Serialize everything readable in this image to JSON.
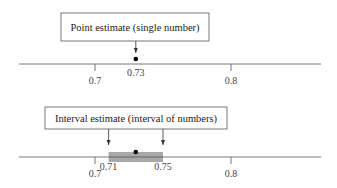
{
  "axis": {
    "min_value": 0.7,
    "max_value": 0.8,
    "tick_labels": [
      "0.7",
      "0.8"
    ]
  },
  "point_panel": {
    "label": "Point estimate (single number)",
    "estimate": 0.73,
    "estimate_label": "0.73",
    "ticks": [
      {
        "value": 0.7,
        "label": "0.7"
      },
      {
        "value": 0.8,
        "label": "0.8"
      }
    ]
  },
  "interval_panel": {
    "label": "Interval estimate (interval of numbers)",
    "estimate": 0.73,
    "lower": 0.71,
    "upper": 0.75,
    "lower_label": "0.71",
    "upper_label": "0.75",
    "ticks": [
      {
        "value": 0.7,
        "label": "0.7"
      },
      {
        "value": 0.8,
        "label": "0.8"
      }
    ]
  },
  "colors": {
    "interval_fill": "#a8a8a8",
    "line": "#555555",
    "dot": "#000000"
  }
}
